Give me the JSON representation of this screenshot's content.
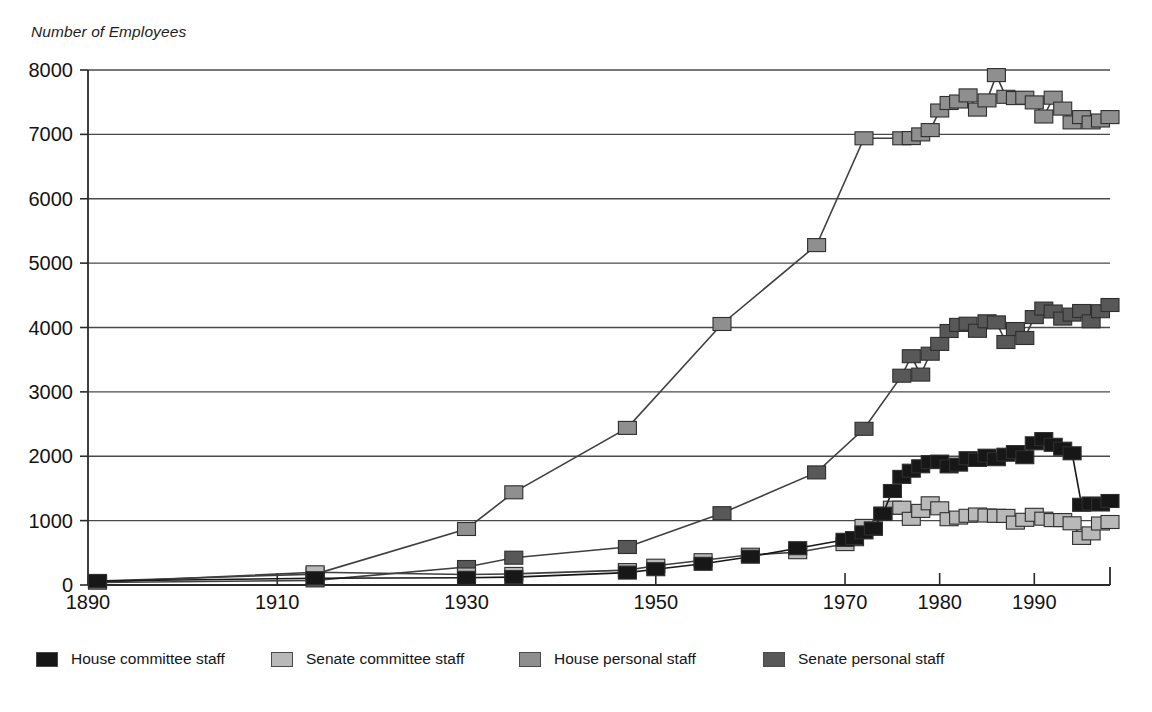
{
  "chart_data": {
    "type": "line",
    "title": "",
    "subtitle": "",
    "ylabel": "Number of Employees",
    "xlabel": "",
    "ylim": [
      0,
      8000
    ],
    "xlim": [
      1890,
      1998
    ],
    "yticks": [
      0,
      1000,
      2000,
      3000,
      4000,
      5000,
      6000,
      7000,
      8000
    ],
    "xticks": [
      1890,
      1910,
      1930,
      1950,
      1970,
      1980,
      1990
    ],
    "grid": "horizontal",
    "legend_position": "bottom",
    "marker": "square",
    "series": [
      {
        "name": "House committee staff",
        "color": "#171717",
        "x": [
          1891,
          1914,
          1930,
          1935,
          1947,
          1950,
          1955,
          1960,
          1965,
          1970,
          1971,
          1972,
          1973,
          1974,
          1975,
          1976,
          1977,
          1978,
          1979,
          1980,
          1981,
          1982,
          1983,
          1984,
          1985,
          1986,
          1987,
          1988,
          1989,
          1990,
          1991,
          1992,
          1993,
          1994,
          1995,
          1996,
          1997,
          1998
        ],
        "y": [
          62,
          105,
          112,
          122,
          193,
          246,
          329,
          440,
          571,
          702,
          729,
          817,
          878,
          1107,
          1460,
          1680,
          1776,
          1844,
          1909,
          1917,
          1843,
          1871,
          1970,
          1944,
          2009,
          1954,
          2024,
          2065,
          1986,
          2201,
          2267,
          2178,
          2118,
          2046,
          1246,
          1266,
          1250,
          1305
        ],
        "annual_from": 1970
      },
      {
        "name": "Senate committee staff",
        "color": "#b9b9b9",
        "x": [
          1891,
          1914,
          1930,
          1935,
          1947,
          1950,
          1955,
          1960,
          1965,
          1970,
          1971,
          1972,
          1973,
          1974,
          1975,
          1976,
          1977,
          1978,
          1979,
          1980,
          1981,
          1982,
          1983,
          1984,
          1985,
          1986,
          1987,
          1988,
          1989,
          1990,
          1991,
          1992,
          1993,
          1994,
          1995,
          1996,
          1997,
          1998
        ],
        "y": [
          41,
          198,
          163,
          172,
          232,
          300,
          386,
          470,
          509,
          635,
          711,
          918,
          873,
          1107,
          1201,
          1201,
          1028,
          1151,
          1269,
          1191,
          1022,
          1047,
          1075,
          1095,
          1080,
          1075,
          1074,
          970,
          1013,
          1090,
          1030,
          1008,
          1008,
          958,
          732,
          801,
          955,
          979
        ],
        "annual_from": 1970
      },
      {
        "name": "House personal staff",
        "color": "#8f8f8f",
        "x": [
          1891,
          1914,
          1930,
          1935,
          1947,
          1957,
          1967,
          1972,
          1976,
          1977,
          1978,
          1979,
          1980,
          1981,
          1982,
          1983,
          1984,
          1985,
          1986,
          1987,
          1988,
          1989,
          1990,
          1991,
          1992,
          1993,
          1994,
          1995,
          1996,
          1997,
          1998
        ],
        "y": [
          62,
          170,
          870,
          1440,
          2441,
          4055,
          5280,
          6939,
          6939,
          6942,
          7000,
          7067,
          7371,
          7487,
          7511,
          7606,
          7385,
          7528,
          7920,
          7584,
          7564,
          7569,
          7496,
          7278,
          7569,
          7400,
          7186,
          7269,
          7186,
          7215,
          7269
        ],
        "annual_from": 1976
      },
      {
        "name": "Senate personal staff",
        "color": "#585858",
        "x": [
          1891,
          1914,
          1930,
          1935,
          1947,
          1957,
          1967,
          1972,
          1976,
          1977,
          1978,
          1979,
          1980,
          1981,
          1982,
          1983,
          1984,
          1985,
          1986,
          1987,
          1988,
          1989,
          1990,
          1991,
          1992,
          1993,
          1994,
          1995,
          1996,
          1997,
          1998
        ],
        "y": [
          39,
          72,
          280,
          424,
          590,
          1115,
          1749,
          2426,
          3251,
          3554,
          3268,
          3593,
          3746,
          3945,
          4041,
          4059,
          3949,
          4097,
          4080,
          3774,
          3977,
          3837,
          4162,
          4294,
          4249,
          4138,
          4200,
          4256,
          4096,
          4253,
          4350
        ],
        "annual_from": 1976
      }
    ]
  },
  "legend": {
    "items": [
      {
        "label": "House committee staff",
        "color": "#171717"
      },
      {
        "label": "Senate committee staff",
        "color": "#b9b9b9"
      },
      {
        "label": "House personal staff",
        "color": "#8f8f8f"
      },
      {
        "label": "Senate personal staff",
        "color": "#585858"
      }
    ]
  },
  "colors": {
    "axis": "#2a2a2a",
    "grid": "#4a4a4a",
    "background": "#ffffff",
    "text": "#151515"
  }
}
